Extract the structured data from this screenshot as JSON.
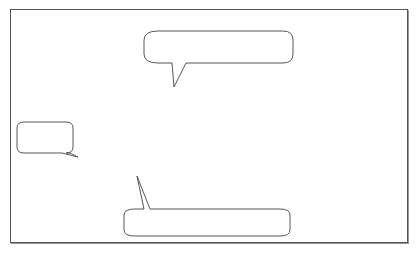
{
  "diagram": {
    "type": "precedence-network-forward-pass",
    "tasks": [
      {
        "id": "A",
        "label": "Task A",
        "duration": "6 Days",
        "early_start": "1",
        "early_finish": "6"
      },
      {
        "id": "B",
        "label": "Task B",
        "duration": "8 Days",
        "early_start": "7",
        "early_finish": "14"
      },
      {
        "id": "C",
        "label": "Task C",
        "duration": "4 Days",
        "early_start": "7",
        "early_finish": "10"
      },
      {
        "id": "E",
        "label": "Task E",
        "duration": "7 Days",
        "early_start": "15",
        "early_finish": "21"
      }
    ],
    "edges": [
      {
        "from": "A",
        "to": "B"
      },
      {
        "from": "A",
        "to": "C"
      },
      {
        "from": "B",
        "to": "E"
      },
      {
        "from": "C",
        "to": "E"
      }
    ],
    "callouts": [
      {
        "id": "1",
        "lines": [
          "1. Start",
          "with Day"
        ]
      },
      {
        "id": "2",
        "lines": [
          "2. Add the duration and subtract 1 to",
          "get the early finish of each task."
        ]
      },
      {
        "id": "3",
        "lines": [
          "3. Task B is dependent on Task",
          "A, so its early start is the day",
          "after Task A is finished."
        ]
      },
      {
        "id": "4",
        "lines": [
          "4. Because",
          "Task E is",
          "dependent on",
          "both",
          "Task B and",
          "Task C, the",
          "earliest Task",
          "E can start is",
          "the day after",
          "the",
          "predecessor",
          "that takes",
          "longest time",
          "to finish is",
          "completed."
        ]
      }
    ],
    "colors": {
      "stroke": "#444444",
      "background": "#ffffff",
      "text": "#222222"
    }
  }
}
